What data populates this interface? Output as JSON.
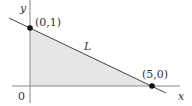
{
  "diagram": {
    "axes": {
      "x_label": "x",
      "y_label": "y",
      "origin_label": "0"
    },
    "line": {
      "label": "L",
      "points": [
        {
          "x": 0,
          "y": 1,
          "label": "(0,1)"
        },
        {
          "x": 5,
          "y": 0,
          "label": "(5,0)"
        }
      ]
    },
    "region": {
      "description": "triangle bounded by axes and line L",
      "fill": "#e6e6e6"
    },
    "colors": {
      "axis": "#888888",
      "line": "#444444",
      "point": "#111111"
    }
  }
}
